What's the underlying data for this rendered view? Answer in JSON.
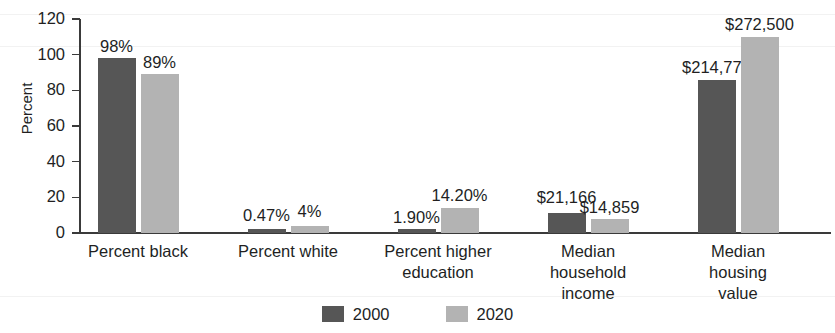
{
  "chart_data": {
    "type": "bar",
    "title": "",
    "subtitle": "",
    "xlabel": "",
    "ylabel": "Percent",
    "ylim": [
      0,
      120
    ],
    "yticks": [
      0,
      20,
      40,
      60,
      80,
      100,
      120
    ],
    "grid": false,
    "legend_position": "bottom-center",
    "categories": [
      "Percent black",
      "Percent white",
      "Percent higher\neducation",
      "Median\nhousehold\nincome",
      "Median\nhousing\nvalue"
    ],
    "series": [
      {
        "name": "2000",
        "color": "#565656",
        "values": [
          98,
          0.47,
          1.9,
          11,
          86
        ],
        "labels": [
          "98%",
          "0.47%",
          "1.90%",
          "$21,166",
          "$214,775"
        ]
      },
      {
        "name": "2020",
        "color": "#b3b3b3",
        "values": [
          89,
          4,
          14.2,
          8,
          110
        ],
        "labels": [
          "89%",
          "4%",
          "14.20%",
          "$14,859",
          "$272,500"
        ]
      }
    ],
    "annotations": [
      "Bars for Median household income and Median housing value are drawn on the same Percent axis but labelled with dollar amounts."
    ]
  },
  "legend": {
    "items": [
      {
        "label": "2000",
        "swatch": "dark-gray-swatch-icon"
      },
      {
        "label": "2020",
        "swatch": "light-gray-swatch-icon"
      }
    ]
  }
}
